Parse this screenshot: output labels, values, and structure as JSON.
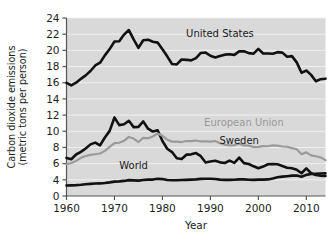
{
  "chart_data": {
    "type": "line",
    "title": "",
    "xlabel": "Year",
    "ylabel": "Carbon dioxide emissions (metric tons per person)",
    "ylabel_line1": "Carbon dioxide emissions",
    "ylabel_line2": "(metric tons per person)",
    "xlim": [
      1960,
      2014
    ],
    "ylim": [
      0,
      24
    ],
    "x_ticks": [
      1960,
      1970,
      1980,
      1990,
      2000,
      2010
    ],
    "x_tick_labels": [
      "1960",
      "1970",
      "1980",
      "1990",
      "2000",
      "2010"
    ],
    "y_ticks": [
      0,
      4,
      6,
      8,
      10,
      12,
      14,
      16,
      18,
      20,
      22,
      24
    ],
    "y_tick_labels": [
      "0",
      "4",
      "6",
      "8",
      "10",
      "12",
      "14",
      "16",
      "18",
      "20",
      "22",
      "24"
    ],
    "y_axis_break": true,
    "y_axis_break_note": "Axis compressed between 0 and 4",
    "grid": "horizontal",
    "grid_color": "#f0f0f0",
    "plot_background": "#d9d9d9",
    "legend_position": "inline-annotations",
    "series": [
      {
        "name": "United States",
        "color": "#111111",
        "line_width": 2.6,
        "label_x": 1992,
        "label_y": 21.6,
        "x": [
          1960,
          1961,
          1962,
          1963,
          1964,
          1965,
          1966,
          1967,
          1968,
          1969,
          1970,
          1971,
          1972,
          1973,
          1974,
          1975,
          1976,
          1977,
          1978,
          1979,
          1980,
          1981,
          1982,
          1983,
          1984,
          1985,
          1986,
          1987,
          1988,
          1989,
          1990,
          1991,
          1992,
          1993,
          1994,
          1995,
          1996,
          1997,
          1998,
          1999,
          2000,
          2001,
          2002,
          2003,
          2004,
          2005,
          2006,
          2007,
          2008,
          2009,
          2010,
          2011,
          2012,
          2013,
          2014
        ],
        "values": [
          15.99,
          15.68,
          16.01,
          16.48,
          16.91,
          17.45,
          18.13,
          18.48,
          19.38,
          20.16,
          21.1,
          21.13,
          21.95,
          22.51,
          21.36,
          20.32,
          21.25,
          21.32,
          21.06,
          20.96,
          20.13,
          19.26,
          18.32,
          18.26,
          18.87,
          18.83,
          18.76,
          19.04,
          19.68,
          19.73,
          19.33,
          19.11,
          19.3,
          19.47,
          19.53,
          19.44,
          19.87,
          19.89,
          19.66,
          19.59,
          20.18,
          19.61,
          19.62,
          19.59,
          19.78,
          19.72,
          19.21,
          19.29,
          18.52,
          17.23,
          17.5,
          16.97,
          16.19,
          16.44,
          16.5
        ]
      },
      {
        "name": "Sweden",
        "color": "#111111",
        "line_width": 2.6,
        "label_x": 1996,
        "label_y": 8.4,
        "x": [
          1960,
          1961,
          1962,
          1963,
          1964,
          1965,
          1966,
          1967,
          1968,
          1969,
          1970,
          1971,
          1972,
          1973,
          1974,
          1975,
          1976,
          1977,
          1978,
          1979,
          1980,
          1981,
          1982,
          1983,
          1984,
          1985,
          1986,
          1987,
          1988,
          1989,
          1990,
          1991,
          1992,
          1993,
          1994,
          1995,
          1996,
          1997,
          1998,
          1999,
          2000,
          2001,
          2002,
          2003,
          2004,
          2005,
          2006,
          2007,
          2008,
          2009,
          2010,
          2011,
          2012,
          2013,
          2014
        ],
        "values": [
          6.71,
          6.54,
          7.13,
          7.45,
          7.88,
          8.38,
          8.6,
          8.25,
          9.23,
          10.05,
          11.7,
          10.76,
          10.87,
          11.3,
          10.51,
          10.54,
          11.22,
          10.32,
          9.97,
          10.13,
          8.79,
          7.84,
          7.43,
          6.67,
          6.58,
          7.11,
          7.15,
          7.31,
          6.92,
          6.15,
          6.26,
          6.35,
          6.16,
          6.08,
          6.38,
          6.09,
          6.75,
          6.06,
          5.95,
          5.67,
          5.44,
          5.64,
          5.92,
          5.94,
          5.93,
          5.72,
          5.5,
          5.44,
          5.25,
          4.81,
          5.41,
          4.81,
          4.6,
          4.51,
          4.47
        ]
      },
      {
        "name": "European Union",
        "color": "#9a9a9a",
        "line_width": 2.2,
        "label_x": 1997,
        "label_y": 10.6,
        "x": [
          1960,
          1961,
          1962,
          1963,
          1964,
          1965,
          1966,
          1967,
          1968,
          1969,
          1970,
          1971,
          1972,
          1973,
          1974,
          1975,
          1976,
          1977,
          1978,
          1979,
          1980,
          1981,
          1982,
          1983,
          1984,
          1985,
          1986,
          1987,
          1988,
          1989,
          1990,
          1991,
          1992,
          1993,
          1994,
          1995,
          1996,
          1997,
          1998,
          1999,
          2000,
          2001,
          2002,
          2003,
          2004,
          2005,
          2006,
          2007,
          2008,
          2009,
          2010,
          2011,
          2012,
          2013,
          2014
        ],
        "values": [
          5.92,
          6.08,
          6.34,
          6.72,
          6.94,
          7.08,
          7.16,
          7.25,
          7.58,
          8.07,
          8.53,
          8.58,
          8.82,
          9.3,
          9.1,
          8.67,
          9.18,
          9.13,
          9.35,
          9.72,
          9.44,
          8.96,
          8.72,
          8.72,
          8.67,
          8.8,
          8.79,
          8.86,
          8.74,
          8.75,
          8.71,
          8.8,
          8.52,
          8.33,
          8.26,
          8.29,
          8.47,
          8.25,
          8.22,
          8.05,
          8.07,
          8.17,
          8.15,
          8.25,
          8.22,
          8.12,
          8.09,
          7.91,
          7.78,
          7.17,
          7.39,
          7.02,
          6.91,
          6.77,
          6.43
        ]
      },
      {
        "name": "World",
        "color": "#111111",
        "line_width": 2.6,
        "label_x": 1974,
        "label_y": 5.3,
        "x": [
          1960,
          1961,
          1962,
          1963,
          1964,
          1965,
          1966,
          1967,
          1968,
          1969,
          1970,
          1971,
          1972,
          1973,
          1974,
          1975,
          1976,
          1977,
          1978,
          1979,
          1980,
          1981,
          1982,
          1983,
          1984,
          1985,
          1986,
          1987,
          1988,
          1989,
          1990,
          1991,
          1992,
          1993,
          1994,
          1995,
          1996,
          1997,
          1998,
          1999,
          2000,
          2001,
          2002,
          2003,
          2004,
          2005,
          2006,
          2007,
          2008,
          2009,
          2010,
          2011,
          2012,
          2013,
          2014
        ],
        "values": [
          2.6,
          2.63,
          2.68,
          2.78,
          2.91,
          2.99,
          3.08,
          3.11,
          3.22,
          3.37,
          3.56,
          3.62,
          3.73,
          3.92,
          3.86,
          3.81,
          3.96,
          4.02,
          4.03,
          4.14,
          4.09,
          3.96,
          3.9,
          3.88,
          3.95,
          3.99,
          4.02,
          4.05,
          4.12,
          4.13,
          4.14,
          4.11,
          4.02,
          3.99,
          3.98,
          4.0,
          4.05,
          4.05,
          4.01,
          3.99,
          4.03,
          4.03,
          4.05,
          4.17,
          4.31,
          4.39,
          4.45,
          4.52,
          4.53,
          4.38,
          4.61,
          4.71,
          4.75,
          4.78,
          4.8
        ]
      }
    ]
  },
  "axis": {
    "x_title": "Year",
    "y_title_line1": "Carbon dioxide emissions",
    "y_title_line2": "(metric tons per person)"
  },
  "annotations": {
    "united_states": "United States",
    "european_union": "European Union",
    "sweden": "Sweden",
    "world": "World"
  }
}
